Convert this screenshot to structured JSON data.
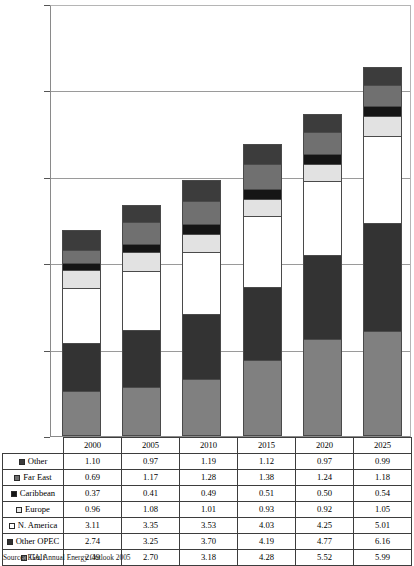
{
  "chart_data": {
    "type": "bar",
    "stacked": true,
    "title": "",
    "xlabel": "",
    "ylabel": "",
    "ylim": [
      0,
      25
    ],
    "yticks": [
      0,
      5,
      10,
      15,
      20,
      25
    ],
    "grid": true,
    "legend_position": "table-row-labels",
    "categories": [
      "2000",
      "2005",
      "2010",
      "2015",
      "2020",
      "2025"
    ],
    "stack_order_bottom_to_top": [
      "Gulf",
      "Other OPEC",
      "N. America",
      "Europe",
      "Caribbean",
      "Far East",
      "Other"
    ],
    "series": [
      {
        "name": "Other",
        "swatch": "s-other",
        "fill": "f-other",
        "color": "#3c3c3c",
        "values": [
          1.1,
          0.97,
          1.19,
          1.12,
          0.97,
          0.99
        ]
      },
      {
        "name": "Far East",
        "swatch": "s-fareast",
        "fill": "f-fareast",
        "color": "#707070",
        "values": [
          0.69,
          1.17,
          1.28,
          1.38,
          1.24,
          1.18
        ]
      },
      {
        "name": "Caribbean",
        "swatch": "s-caribbean",
        "fill": "f-caribbean",
        "color": "#151515",
        "values": [
          0.37,
          0.41,
          0.49,
          0.51,
          0.5,
          0.54
        ]
      },
      {
        "name": "Europe",
        "swatch": "s-europe",
        "fill": "f-europe",
        "color": "#e2e2e2",
        "values": [
          0.96,
          1.08,
          1.01,
          0.93,
          0.92,
          1.05
        ]
      },
      {
        "name": "N. America",
        "swatch": "s-namerica",
        "fill": "f-namerica",
        "color": "#ffffff",
        "values": [
          3.11,
          3.35,
          3.53,
          4.03,
          4.25,
          5.01
        ]
      },
      {
        "name": "Other OPEC",
        "swatch": "s-otheropec",
        "fill": "f-otheropec",
        "color": "#333333",
        "values": [
          2.74,
          3.25,
          3.7,
          4.19,
          4.77,
          6.16
        ]
      },
      {
        "name": "Gulf",
        "swatch": "s-gulf",
        "fill": "f-gulf",
        "color": "#808080",
        "values": [
          2.49,
          2.7,
          3.18,
          4.28,
          5.52,
          5.99
        ]
      }
    ],
    "totals": [
      11.46,
      12.93,
      14.38,
      16.44,
      18.17,
      20.92
    ]
  },
  "source": {
    "note": "Source: EIA, Annual Energy Outlook 2005"
  }
}
